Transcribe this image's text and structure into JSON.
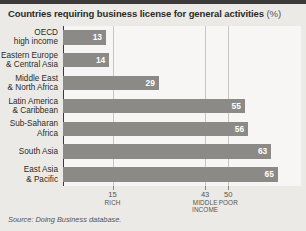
{
  "title": {
    "main": "Countries requiring business license for general activities",
    "unit": "(%)"
  },
  "source": "Source: Doing Business database.",
  "chart_data": {
    "type": "bar",
    "orientation": "horizontal",
    "title": "Countries requiring business license for general activities (%)",
    "xlabel": "",
    "ylabel": "",
    "xlim": [
      0,
      72
    ],
    "grid": true,
    "legend": "none",
    "categories": [
      "OECD high income",
      "Eastern Europe & Central Asia",
      "Middle East & North Africa",
      "Latin America & Caribbean",
      "Sub-Saharan Africa",
      "South Asia",
      "East Asia & Pacific"
    ],
    "category_lines": [
      [
        "OECD",
        "high income"
      ],
      [
        "Eastern Europe",
        "& Central Asia"
      ],
      [
        "Middle East",
        "& North Africa"
      ],
      [
        "Latin America",
        "& Caribbean"
      ],
      [
        "Sub-Saharan",
        "Africa"
      ],
      [
        "South Asia"
      ],
      [
        "East Asia",
        "& Pacific"
      ]
    ],
    "values": [
      13,
      14,
      29,
      55,
      56,
      63,
      65
    ],
    "xticks": [
      15,
      43,
      50
    ],
    "xtick_notes": [
      "RICH",
      "MIDDLE INCOME",
      "POOR"
    ],
    "bar_color": "#8c8a86",
    "background_color": "#eceae6",
    "plot_background_color": "#f7f6f4"
  }
}
